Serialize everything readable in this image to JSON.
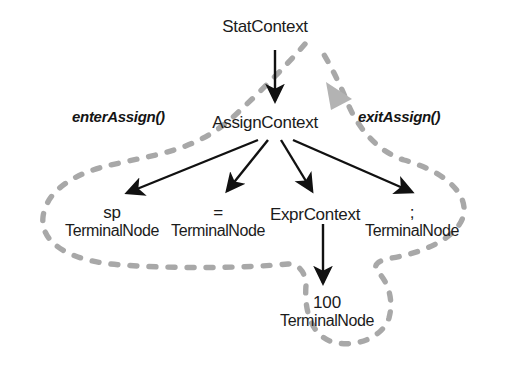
{
  "diagram": {
    "colors": {
      "text": "#1b1b1b",
      "arrow": "#111111",
      "walk_path": "#a8a8a8",
      "walk_marker": "#b3b3b3",
      "background": "#ffffff"
    },
    "callouts": [
      {
        "id": "enter",
        "label": "enterAssign()",
        "x": 72,
        "y": 108
      },
      {
        "id": "exit",
        "label": "exitAssign()",
        "x": 358,
        "y": 108
      }
    ],
    "nodes": [
      {
        "id": "stat",
        "title": "StatContext",
        "sub": "",
        "tok": "",
        "x": 265,
        "y": 18
      },
      {
        "id": "assign",
        "title": "AssignContext",
        "sub": "",
        "tok": "",
        "x": 265,
        "y": 114
      },
      {
        "id": "sp",
        "title": "",
        "sub": "TerminalNode",
        "tok": "sp",
        "x": 112,
        "y": 204
      },
      {
        "id": "eq",
        "title": "",
        "sub": "TerminalNode",
        "tok": "=",
        "x": 218,
        "y": 204
      },
      {
        "id": "expr",
        "title": "ExprContext",
        "sub": "",
        "tok": "",
        "x": 315,
        "y": 206
      },
      {
        "id": "semi",
        "title": "",
        "sub": "TerminalNode",
        "tok": ";",
        "x": 412,
        "y": 204
      },
      {
        "id": "hundred",
        "title": "",
        "sub": "TerminalNode",
        "tok": "100",
        "x": 327,
        "y": 294
      }
    ],
    "edges": [
      {
        "from": "stat",
        "to": "assign",
        "kind": "vertical"
      },
      {
        "from": "assign",
        "to": "sp",
        "kind": "diagonal"
      },
      {
        "from": "assign",
        "to": "eq",
        "kind": "diagonal"
      },
      {
        "from": "assign",
        "to": "expr",
        "kind": "diagonal"
      },
      {
        "from": "assign",
        "to": "semi",
        "kind": "diagonal"
      },
      {
        "from": "expr",
        "to": "hundred",
        "kind": "vertical"
      }
    ],
    "walk_path_description": "gray dashed tree-walk loop enclosing the subtree"
  }
}
